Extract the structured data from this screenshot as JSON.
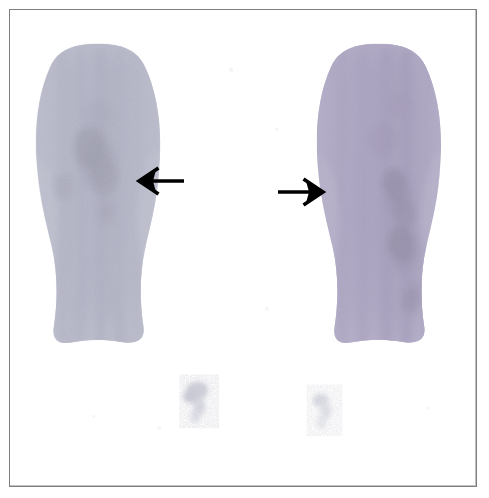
{
  "figure": {
    "kind": "nuclear-medicine-scintigraphy",
    "modality_label": "bone scintigraphy planar image",
    "caption": "",
    "canvas": {
      "width": 489,
      "height": 498,
      "background": "#ffffff"
    },
    "frame": {
      "present": true,
      "left": 9,
      "top": 9,
      "width": 468,
      "height": 478,
      "border_color": "#7e7f80",
      "border_width": 1,
      "inner_background": "#ffffff"
    },
    "palette": {
      "background": "#ffffff",
      "frame_border": "#7e7f80",
      "arrow": "#000000",
      "uptake_faint": "#e3e4ec",
      "uptake_low": "#c6c8d6",
      "uptake_mid": "#9a99b4",
      "uptake_high": "#6f6a8d",
      "uptake_hot": "#3a3550",
      "uptake_hottest": "#120f1c",
      "tint_violet": "#8e86a8",
      "tint_blue_gray": "#aab0c2",
      "tint_olive": "#8c8d73"
    },
    "regions": [
      {
        "id": "left-scintigram",
        "name": "left-limb-scintigram",
        "label": "Left bone scintigram",
        "bounds": {
          "x": 28,
          "y": 42,
          "width": 120,
          "height": 300
        },
        "axis_x": 86,
        "dominant_tint": "#aab0c2",
        "description": "Vertical elongated tracer-uptake column, speckled, widest superiorly, waisted at mid-shaft, flared inferiorly",
        "hotspots": [
          {
            "id": "left-hotspot-primary",
            "cx": 88,
            "cy": 152,
            "rx": 22,
            "ry": 34,
            "intensity": "hottest"
          },
          {
            "id": "left-hotspot-secondary",
            "cx": 96,
            "cy": 200,
            "rx": 14,
            "ry": 20,
            "intensity": "hot"
          }
        ]
      },
      {
        "id": "right-scintigram",
        "name": "right-limb-scintigram",
        "label": "Right bone scintigram",
        "bounds": {
          "x": 322,
          "y": 42,
          "width": 122,
          "height": 300
        },
        "axis_x": 382,
        "dominant_tint": "#8e86a8",
        "description": "Vertical elongated tracer-uptake column with a dense linear band of increased uptake along the right-of-centre cortex",
        "hotspots": [
          {
            "id": "right-hotspot-upper",
            "cx": 392,
            "cy": 186,
            "rx": 16,
            "ry": 26,
            "intensity": "hottest"
          },
          {
            "id": "right-hotspot-lower",
            "cx": 396,
            "cy": 238,
            "rx": 17,
            "ry": 28,
            "intensity": "hottest"
          },
          {
            "id": "right-hotspot-inferior",
            "cx": 404,
            "cy": 282,
            "rx": 12,
            "ry": 20,
            "intensity": "hot"
          }
        ]
      },
      {
        "id": "foci-lower-medial",
        "name": "faint-focus-left",
        "label": "Faint inferior focus (left)",
        "bounds": {
          "x": 172,
          "y": 370,
          "width": 34,
          "height": 46
        },
        "dominant_tint": "#c9cbd8",
        "description": "Small faint speckled focus of low-grade tracer activity",
        "hotspots": []
      },
      {
        "id": "foci-lower-lateral",
        "name": "faint-focus-right",
        "label": "Faint inferior focus (right)",
        "bounds": {
          "x": 300,
          "y": 380,
          "width": 30,
          "height": 44
        },
        "dominant_tint": "#d6d8e2",
        "description": "Very faint speckled focus of low-grade tracer activity",
        "hotspots": []
      }
    ],
    "annotations": [
      {
        "id": "arrow-left",
        "name": "annotation-arrow-left",
        "type": "arrow",
        "direction": "left",
        "color": "#000000",
        "tail_x": 183,
        "tail_y": 180,
        "tip_x": 136,
        "tip_y": 180,
        "points_to": "left-scintigram",
        "meaning": "Marks region of abnormal uptake in the left scintigram"
      },
      {
        "id": "arrow-right",
        "name": "annotation-arrow-right",
        "type": "arrow",
        "direction": "right",
        "color": "#000000",
        "tail_x": 276,
        "tail_y": 191,
        "tip_x": 323,
        "tip_y": 191,
        "points_to": "right-scintigram",
        "meaning": "Marks region of abnormal uptake in the right scintigram"
      }
    ],
    "text_labels": []
  }
}
